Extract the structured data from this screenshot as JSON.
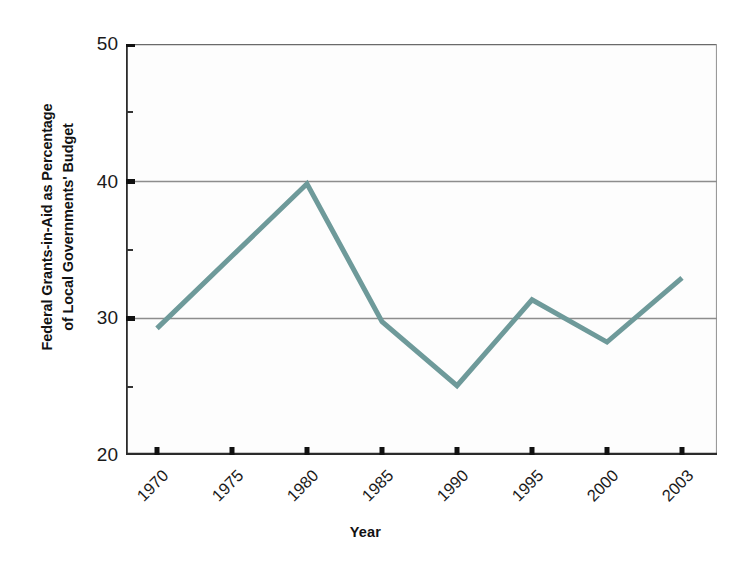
{
  "chart_data": {
    "type": "line",
    "title": "",
    "xlabel": "Year",
    "ylabel": "Federal Grants-in-Aid as Percentage of Local Governments' Budget",
    "ylabel_line1": "Federal Grants-in-Aid as Percentage",
    "ylabel_line2": "of Local Governments' Budget",
    "categories": [
      "1970",
      "1975",
      "1980",
      "1985",
      "1990",
      "1995",
      "2000",
      "2003"
    ],
    "values": [
      29.2,
      34.5,
      39.8,
      29.7,
      25.0,
      31.3,
      28.2,
      32.9
    ],
    "series": [
      {
        "name": "Federal Grants-in-Aid as Percentage of Local Governments' Budget",
        "values": [
          29.2,
          34.5,
          39.8,
          29.7,
          25.0,
          31.3,
          28.2,
          32.9
        ]
      }
    ],
    "ylim": [
      20,
      50
    ],
    "yticks": [
      20,
      30,
      40,
      50
    ],
    "ytick_labels": [
      "20",
      "30",
      "40",
      "50"
    ],
    "xticks": [
      "1970",
      "1975",
      "1980",
      "1985",
      "1990",
      "1995",
      "2000",
      "2003"
    ],
    "grid": true,
    "grid_axis": "y",
    "legend": false,
    "legend_position": "none",
    "line_color": "#6E9A9A",
    "line_width": 5,
    "axis_color": "#2b2b2b",
    "grid_color": "#8d8d8d",
    "plot_background": "#fdfdfd",
    "markers": false
  },
  "axes": {
    "x_title": "Year",
    "y_title_line1": "Federal Grants-in-Aid as Percentage",
    "y_title_line2": "of Local Governments' Budget",
    "y_tick_50": "50",
    "y_tick_40": "40",
    "y_tick_30": "30",
    "y_tick_20": "20",
    "x_tick_0": "1970",
    "x_tick_1": "1975",
    "x_tick_2": "1980",
    "x_tick_3": "1985",
    "x_tick_4": "1990",
    "x_tick_5": "1995",
    "x_tick_6": "2000",
    "x_tick_7": "2003"
  }
}
